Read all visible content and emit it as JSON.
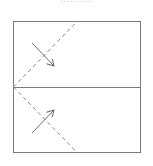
{
  "caption": "..........",
  "diagram": {
    "type": "fold-diagram",
    "colors": {
      "stroke": "#7a7a7a",
      "dashed": "#8a8a8a",
      "arrow": "#6a6a6a"
    },
    "square": {
      "x": 13,
      "y": 21,
      "width": 127,
      "height": 131
    },
    "center_line": {
      "x1": 13,
      "y1": 87,
      "x2": 140,
      "y2": 87
    },
    "fold_lines": [
      {
        "x1": 13,
        "y1": 87,
        "x2": 77,
        "y2": 21,
        "style": "dashed"
      },
      {
        "x1": 13,
        "y1": 87,
        "x2": 77,
        "y2": 152,
        "style": "dashed"
      }
    ],
    "arrows": [
      {
        "name": "upper-fold-arrow",
        "x1": 32,
        "y1": 43,
        "x2": 54,
        "y2": 66,
        "direction": "down-right"
      },
      {
        "name": "lower-fold-arrow",
        "x1": 32,
        "y1": 133,
        "x2": 54,
        "y2": 110,
        "direction": "up-right"
      }
    ]
  }
}
